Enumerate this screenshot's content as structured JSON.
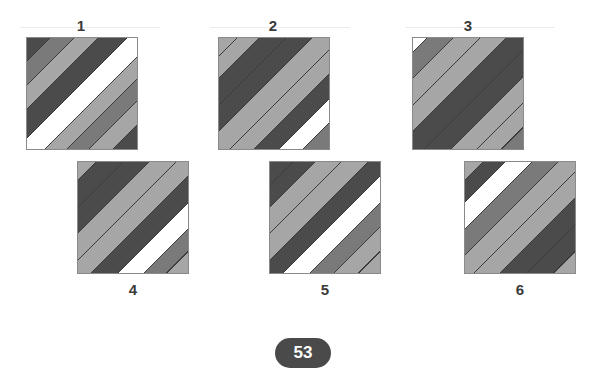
{
  "palette": {
    "dark": "#4b4b4b",
    "mid": "#7a7a7a",
    "light": "#a6a6a6",
    "white": "#ffffff",
    "stripe_line": "#3c3c3c"
  },
  "options": [
    {
      "label": "1",
      "stripes": [
        [
          "dark",
          0,
          10
        ],
        [
          "mid",
          10,
          21
        ],
        [
          "light",
          21,
          32
        ],
        [
          "dark",
          32,
          45
        ],
        [
          "white",
          45,
          58
        ],
        [
          "light",
          58,
          68
        ],
        [
          "mid",
          68,
          78
        ],
        [
          "light",
          78,
          89
        ],
        [
          "dark",
          89,
          100
        ]
      ]
    },
    {
      "label": "2",
      "stripes": [
        [
          "light",
          0,
          8
        ],
        [
          "light",
          8,
          18
        ],
        [
          "dark",
          18,
          30
        ],
        [
          "dark",
          30,
          42
        ],
        [
          "light",
          42,
          55
        ],
        [
          "light",
          55,
          66
        ],
        [
          "dark",
          66,
          77
        ],
        [
          "white",
          77,
          88
        ],
        [
          "mid",
          88,
          100
        ]
      ]
    },
    {
      "label": "3",
      "stripes": [
        [
          "white",
          0,
          6
        ],
        [
          "mid",
          6,
          18
        ],
        [
          "light",
          18,
          30
        ],
        [
          "light",
          30,
          42
        ],
        [
          "dark",
          42,
          55
        ],
        [
          "dark",
          55,
          67
        ],
        [
          "light",
          67,
          79
        ],
        [
          "light",
          79,
          90
        ],
        [
          "mid",
          90,
          100
        ]
      ]
    },
    {
      "label": "4",
      "stripes": [
        [
          "light",
          0,
          8
        ],
        [
          "dark",
          8,
          20
        ],
        [
          "dark",
          20,
          32
        ],
        [
          "light",
          32,
          44
        ],
        [
          "light",
          44,
          56
        ],
        [
          "dark",
          56,
          68
        ],
        [
          "white",
          68,
          80
        ],
        [
          "mid",
          80,
          90
        ],
        [
          "light",
          90,
          100
        ]
      ]
    },
    {
      "label": "5",
      "stripes": [
        [
          "dark",
          0,
          10
        ],
        [
          "dark",
          10,
          20
        ],
        [
          "light",
          20,
          32
        ],
        [
          "light",
          32,
          44
        ],
        [
          "dark",
          44,
          56
        ],
        [
          "white",
          56,
          68
        ],
        [
          "mid",
          68,
          79
        ],
        [
          "light",
          79,
          90
        ],
        [
          "light",
          90,
          100
        ]
      ]
    },
    {
      "label": "6",
      "stripes": [
        [
          "light",
          0,
          8
        ],
        [
          "dark",
          8,
          18
        ],
        [
          "white",
          18,
          30
        ],
        [
          "mid",
          30,
          42
        ],
        [
          "light",
          42,
          54
        ],
        [
          "light",
          54,
          66
        ],
        [
          "dark",
          66,
          78
        ],
        [
          "dark",
          78,
          90
        ],
        [
          "light",
          90,
          100
        ]
      ]
    }
  ],
  "page_number": "53"
}
